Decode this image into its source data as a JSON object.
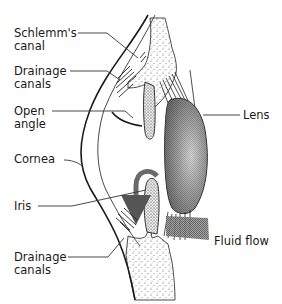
{
  "diagram": {
    "labels": {
      "schlemms_canal_line1": "Schlemm's",
      "schlemms_canal_line2": "canal",
      "drainage_canals_top_line1": "Drainage",
      "drainage_canals_top_line2": "canals",
      "open_angle_line1": "Open",
      "open_angle_line2": "angle",
      "cornea": "Cornea",
      "iris": "Iris",
      "drainage_canals_bottom_line1": "Drainage",
      "drainage_canals_bottom_line2": "canals",
      "lens": "Lens",
      "fluid_flow": "Fluid flow"
    },
    "colors": {
      "background": "#ffffff",
      "ink": "#1a1a1a",
      "lens_shade": "#8a8a8a",
      "fluid_flow_band": "#6e6e6e",
      "stipple": "#555555"
    }
  }
}
